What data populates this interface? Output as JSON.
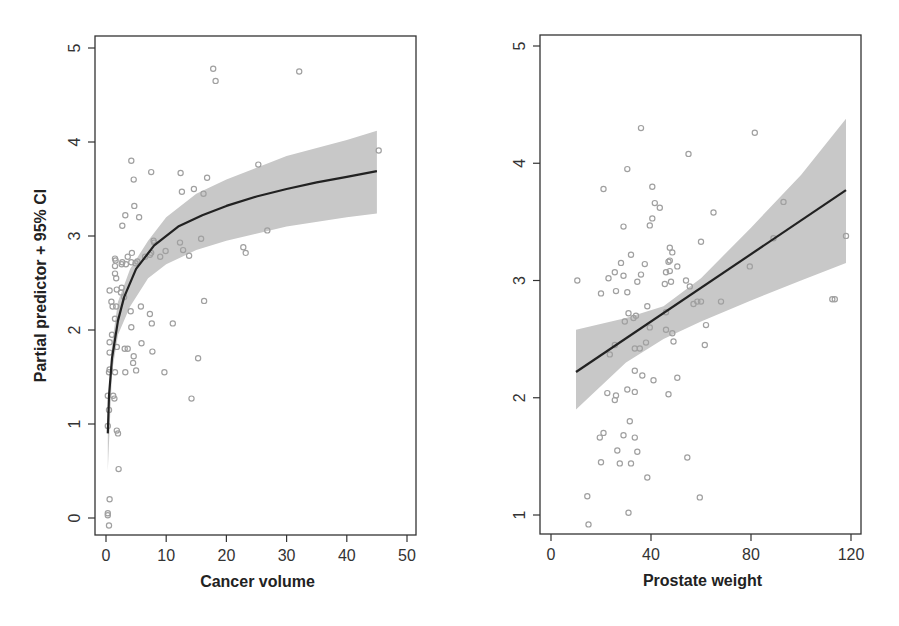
{
  "colors": {
    "axis": "#333333",
    "point_stroke": "#a0a0a0",
    "fit_line": "#222222",
    "ci_band": "#c8c8c8",
    "background": "#ffffff"
  },
  "chart_data": [
    {
      "type": "scatter",
      "title": "",
      "xlabel": "Cancer volume",
      "ylabel": "Partial predictor + 95% CI",
      "xlim": [
        0,
        50
      ],
      "ylim": [
        -0.15,
        5.1
      ],
      "xticks": [
        0,
        10,
        20,
        30,
        40,
        50
      ],
      "yticks": [
        0,
        1,
        2,
        3,
        4,
        5
      ],
      "grid": false,
      "legend": null,
      "points": [
        [
          0.3,
          0.05
        ],
        [
          0.3,
          0.03
        ],
        [
          0.5,
          -0.08
        ],
        [
          0.6,
          0.2
        ],
        [
          0.3,
          0.98
        ],
        [
          0.3,
          1.3
        ],
        [
          0.5,
          1.15
        ],
        [
          1.2,
          1.3
        ],
        [
          1.4,
          1.27
        ],
        [
          0.5,
          1.55
        ],
        [
          1.5,
          1.55
        ],
        [
          1.8,
          0.93
        ],
        [
          2.0,
          0.9
        ],
        [
          2.1,
          0.52
        ],
        [
          0.6,
          1.76
        ],
        [
          0.6,
          1.87
        ],
        [
          1.8,
          1.82
        ],
        [
          0.6,
          1.58
        ],
        [
          1.0,
          1.95
        ],
        [
          1.5,
          2.12
        ],
        [
          1.1,
          2.25
        ],
        [
          1.7,
          2.25
        ],
        [
          0.9,
          2.3
        ],
        [
          2.5,
          2.4
        ],
        [
          3.2,
          1.55
        ],
        [
          3.1,
          1.8
        ],
        [
          3.6,
          1.8
        ],
        [
          4.6,
          1.72
        ],
        [
          4.5,
          1.65
        ],
        [
          5.0,
          1.57
        ],
        [
          4.2,
          2.03
        ],
        [
          4.1,
          2.2
        ],
        [
          5.9,
          1.86
        ],
        [
          5.8,
          2.25
        ],
        [
          7.3,
          2.17
        ],
        [
          7.6,
          2.07
        ],
        [
          7.7,
          1.77
        ],
        [
          9.7,
          1.55
        ],
        [
          11.1,
          2.07
        ],
        [
          14.2,
          1.27
        ],
        [
          15.3,
          1.7
        ],
        [
          16.3,
          2.31
        ],
        [
          0.6,
          2.42
        ],
        [
          1.8,
          2.43
        ],
        [
          2.6,
          2.45
        ],
        [
          3.0,
          2.35
        ],
        [
          1.5,
          2.6
        ],
        [
          1.7,
          2.55
        ],
        [
          1.5,
          2.68
        ],
        [
          2.6,
          2.7
        ],
        [
          3.3,
          2.7
        ],
        [
          4.2,
          2.72
        ],
        [
          4.9,
          2.71
        ],
        [
          5.2,
          2.73
        ],
        [
          1.5,
          2.76
        ],
        [
          1.6,
          2.74
        ],
        [
          4.3,
          2.82
        ],
        [
          2.7,
          2.72
        ],
        [
          3.6,
          2.78
        ],
        [
          7.3,
          2.8
        ],
        [
          7.5,
          2.82
        ],
        [
          9.0,
          2.78
        ],
        [
          12.3,
          2.93
        ],
        [
          12.8,
          2.85
        ],
        [
          13.8,
          2.79
        ],
        [
          15.8,
          2.97
        ],
        [
          22.8,
          2.88
        ],
        [
          23.2,
          2.82
        ],
        [
          2.7,
          3.11
        ],
        [
          3.2,
          3.22
        ],
        [
          5.5,
          3.2
        ],
        [
          4.7,
          3.32
        ],
        [
          4.2,
          3.8
        ],
        [
          4.6,
          3.6
        ],
        [
          7.5,
          3.68
        ],
        [
          12.4,
          3.67
        ],
        [
          12.6,
          3.47
        ],
        [
          14.6,
          3.5
        ],
        [
          16.2,
          3.45
        ],
        [
          16.8,
          3.62
        ],
        [
          25.3,
          3.76
        ],
        [
          26.8,
          3.06
        ],
        [
          45.3,
          3.91
        ],
        [
          17.8,
          4.78
        ],
        [
          18.2,
          4.65
        ],
        [
          32.1,
          4.75
        ],
        [
          7.9,
          2.95
        ],
        [
          8.0,
          2.93
        ],
        [
          9.9,
          2.84
        ],
        [
          6.5,
          2.78
        ]
      ],
      "fit_curve": {
        "x": [
          0.3,
          0.5,
          1,
          2,
          3,
          5,
          8,
          12,
          16,
          20,
          25,
          30,
          35,
          40,
          45
        ],
        "y": [
          0.9,
          1.3,
          1.7,
          2.1,
          2.35,
          2.65,
          2.9,
          3.1,
          3.22,
          3.32,
          3.42,
          3.5,
          3.57,
          3.63,
          3.69
        ]
      },
      "ci_upper": {
        "x": [
          0.3,
          1,
          2,
          4,
          7,
          10,
          15,
          20,
          30,
          40,
          45
        ],
        "y": [
          1.0,
          1.85,
          2.3,
          2.65,
          2.95,
          3.2,
          3.45,
          3.6,
          3.85,
          4.02,
          4.12
        ]
      },
      "ci_lower": {
        "x": [
          0.3,
          1,
          2,
          4,
          7,
          10,
          15,
          20,
          30,
          40,
          45
        ],
        "y": [
          0.5,
          1.55,
          1.95,
          2.25,
          2.55,
          2.7,
          2.85,
          2.95,
          3.1,
          3.2,
          3.24
        ]
      }
    },
    {
      "type": "scatter",
      "title": "",
      "xlabel": "Prostate weight",
      "ylabel": "",
      "xlim": [
        -4,
        124
      ],
      "ylim": [
        0.85,
        5.1
      ],
      "xticks": [
        0,
        40,
        80,
        120
      ],
      "yticks": [
        1,
        2,
        3,
        4,
        5
      ],
      "grid": false,
      "legend": null,
      "points": [
        [
          15.0,
          0.92
        ],
        [
          14.5,
          1.16
        ],
        [
          31.0,
          1.02
        ],
        [
          59.5,
          1.15
        ],
        [
          38.5,
          1.32
        ],
        [
          20.0,
          1.45
        ],
        [
          27.5,
          1.44
        ],
        [
          32.0,
          1.44
        ],
        [
          54.5,
          1.49
        ],
        [
          26.5,
          1.55
        ],
        [
          34.5,
          1.54
        ],
        [
          19.5,
          1.66
        ],
        [
          21.0,
          1.7
        ],
        [
          29.0,
          1.68
        ],
        [
          33.5,
          1.66
        ],
        [
          31.5,
          1.8
        ],
        [
          22.5,
          2.04
        ],
        [
          25.5,
          1.98
        ],
        [
          26.0,
          2.02
        ],
        [
          30.5,
          2.07
        ],
        [
          33.5,
          2.05
        ],
        [
          47.0,
          2.03
        ],
        [
          33.5,
          2.23
        ],
        [
          36.5,
          2.19
        ],
        [
          41.0,
          2.15
        ],
        [
          50.5,
          2.17
        ],
        [
          23.5,
          2.37
        ],
        [
          25.5,
          2.45
        ],
        [
          33.5,
          2.42
        ],
        [
          35.5,
          2.42
        ],
        [
          38.0,
          2.47
        ],
        [
          48.5,
          2.55
        ],
        [
          49.0,
          2.48
        ],
        [
          62.0,
          2.62
        ],
        [
          61.5,
          2.45
        ],
        [
          29.5,
          2.65
        ],
        [
          31.0,
          2.72
        ],
        [
          33.0,
          2.68
        ],
        [
          34.0,
          2.7
        ],
        [
          39.5,
          2.6
        ],
        [
          46.0,
          2.58
        ],
        [
          38.5,
          2.78
        ],
        [
          46.0,
          2.73
        ],
        [
          58.5,
          2.82
        ],
        [
          57.0,
          2.8
        ],
        [
          68.0,
          2.82
        ],
        [
          113.5,
          2.84
        ],
        [
          30.5,
          2.9
        ],
        [
          20.0,
          2.89
        ],
        [
          26.0,
          2.91
        ],
        [
          10.5,
          3.0
        ],
        [
          23.0,
          3.02
        ],
        [
          25.5,
          3.07
        ],
        [
          29.0,
          3.04
        ],
        [
          36.0,
          3.05
        ],
        [
          34.5,
          2.99
        ],
        [
          45.5,
          2.97
        ],
        [
          48.0,
          2.99
        ],
        [
          54.0,
          3.0
        ],
        [
          46.0,
          3.07
        ],
        [
          47.5,
          3.08
        ],
        [
          47.0,
          3.16
        ],
        [
          47.5,
          3.17
        ],
        [
          50.5,
          3.12
        ],
        [
          37.5,
          3.14
        ],
        [
          28.0,
          3.15
        ],
        [
          32.0,
          3.22
        ],
        [
          48.5,
          3.24
        ],
        [
          47.5,
          3.28
        ],
        [
          60.0,
          3.33
        ],
        [
          89.0,
          3.36
        ],
        [
          118.0,
          3.38
        ],
        [
          29.0,
          3.46
        ],
        [
          39.5,
          3.47
        ],
        [
          40.5,
          3.53
        ],
        [
          41.5,
          3.66
        ],
        [
          43.5,
          3.62
        ],
        [
          65.0,
          3.58
        ],
        [
          93.0,
          3.67
        ],
        [
          21.0,
          3.78
        ],
        [
          40.5,
          3.8
        ],
        [
          30.5,
          3.95
        ],
        [
          55.0,
          4.08
        ],
        [
          36.0,
          4.3
        ],
        [
          81.5,
          4.26
        ],
        [
          112.5,
          2.84
        ],
        [
          79.5,
          3.12
        ],
        [
          55.5,
          2.95
        ],
        [
          60.0,
          2.82
        ]
      ],
      "fit_line": {
        "x": [
          10,
          118
        ],
        "y": [
          2.22,
          3.77
        ]
      },
      "ci_upper": {
        "x": [
          10,
          30,
          45,
          60,
          80,
          100,
          118
        ],
        "y": [
          2.58,
          2.68,
          2.78,
          3.02,
          3.45,
          3.9,
          4.38
        ]
      },
      "ci_lower": {
        "x": [
          10,
          30,
          45,
          60,
          80,
          100,
          118
        ],
        "y": [
          1.9,
          2.3,
          2.5,
          2.65,
          2.83,
          3.0,
          3.15
        ]
      }
    }
  ]
}
